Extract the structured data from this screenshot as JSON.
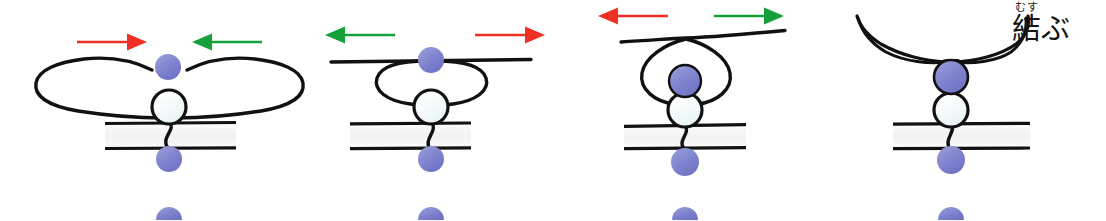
{
  "figure": {
    "width": 1106,
    "height": 220,
    "background": "#ffffff"
  },
  "caption": {
    "furigana": "むす",
    "base": "結ぶ",
    "full": "結ぶ",
    "reading": "musubu",
    "color": "#141414"
  },
  "colors": {
    "rope": "#111111",
    "membrane_line": "#111111",
    "membrane_fill": "#f4f4f4",
    "bead_blue": "#7b7fcc",
    "bead_blue_edge": "#6b6fc0",
    "bead_white": "#f2fafa",
    "bead_white_edge": "#111111",
    "arrow_red": "#ee3124",
    "arrow_green": "#16a03c",
    "background": "#ffffff"
  },
  "panels": [
    {
      "id": "panel-1",
      "index": 1,
      "label": "step-1-loose-bow",
      "rope_state": "two wide loose loops forming a bowtie above the membrane",
      "arrows": [
        {
          "name": "arrow-left-red-right",
          "color": "#ee3124",
          "direction": "right",
          "x1": 77,
          "y1": 42,
          "x2": 143,
          "y2": 42
        },
        {
          "name": "arrow-right-green-left",
          "color": "#16a03c",
          "direction": "left",
          "x1": 262,
          "y1": 42,
          "x2": 196,
          "y2": 42
        }
      ],
      "beads": [
        {
          "name": "bead-blue-top",
          "type": "blue",
          "cx": 168,
          "cy": 67,
          "r": 13
        },
        {
          "name": "bead-white-knot",
          "type": "white",
          "cx": 169,
          "cy": 107,
          "r": 17
        },
        {
          "name": "bead-blue-below-membrane",
          "type": "blue",
          "cx": 169,
          "cy": 159,
          "r": 13
        },
        {
          "name": "bead-blue-partial-bottom",
          "type": "blue-half",
          "cx": 169,
          "cy": 213,
          "r": 13
        }
      ],
      "membrane": {
        "x1": 105,
        "x2": 236,
        "y_top": 123,
        "y_bottom": 148
      }
    },
    {
      "id": "panel-2",
      "index": 2,
      "label": "step-2-single-flat-loop",
      "rope_state": "loops pulled into a single flat horizontal oval under a straight cord",
      "arrows": [
        {
          "name": "arrow-left-green-left",
          "color": "#16a03c",
          "direction": "left",
          "x1": 395,
          "y1": 35,
          "x2": 329,
          "y2": 35
        },
        {
          "name": "arrow-right-red-right",
          "color": "#ee3124",
          "direction": "right",
          "x1": 475,
          "y1": 35,
          "x2": 541,
          "y2": 35
        }
      ],
      "beads": [
        {
          "name": "bead-blue-top",
          "type": "blue",
          "cx": 431,
          "cy": 60,
          "r": 13
        },
        {
          "name": "bead-white-knot",
          "type": "white",
          "cx": 431,
          "cy": 107,
          "r": 17
        },
        {
          "name": "bead-blue-below-membrane",
          "type": "blue",
          "cx": 431,
          "cy": 159,
          "r": 13
        },
        {
          "name": "bead-blue-partial-bottom",
          "type": "blue-half",
          "cx": 431,
          "cy": 213,
          "r": 13
        }
      ],
      "membrane": {
        "x1": 350,
        "x2": 471,
        "y_top": 123,
        "y_bottom": 148
      }
    },
    {
      "id": "panel-3",
      "index": 3,
      "label": "step-3-loop-cinching",
      "rope_state": "loop narrowed into a round ring with blue bead drawn down into it",
      "arrows": [
        {
          "name": "arrow-left-red-left",
          "color": "#ee3124",
          "direction": "left",
          "x1": 668,
          "y1": 16,
          "x2": 602,
          "y2": 16
        },
        {
          "name": "arrow-right-green-right",
          "color": "#16a03c",
          "direction": "right",
          "x1": 714,
          "y1": 16,
          "x2": 780,
          "y2": 16
        },
        {
          "name": "arrow-third-panel-count",
          "color": "#ee3124",
          "direction": "none",
          "x1": 0,
          "y1": 0,
          "x2": 0,
          "y2": 0
        }
      ],
      "beads": [
        {
          "name": "bead-blue-in-loop",
          "type": "blue",
          "cx": 685,
          "cy": 81,
          "r": 16
        },
        {
          "name": "bead-white-knot",
          "type": "white",
          "cx": 685,
          "cy": 110,
          "r": 17
        },
        {
          "name": "bead-blue-below-membrane",
          "type": "blue",
          "cx": 685,
          "cy": 162,
          "r": 14
        },
        {
          "name": "bead-blue-partial-bottom",
          "type": "blue-half",
          "cx": 685,
          "cy": 213,
          "r": 13
        }
      ],
      "membrane": {
        "x1": 624,
        "x2": 746,
        "y_top": 125,
        "y_bottom": 148
      }
    },
    {
      "id": "panel-4",
      "index": 4,
      "label": "step-4-knot-tied",
      "rope_state": "knot fully tightened, two free ends sweep upward and outward",
      "arrows": [],
      "beads": [
        {
          "name": "bead-blue-knotted",
          "type": "blue",
          "cx": 951,
          "cy": 77,
          "r": 17
        },
        {
          "name": "bead-white-knot",
          "type": "white",
          "cx": 951,
          "cy": 110,
          "r": 17
        },
        {
          "name": "bead-blue-below-membrane",
          "type": "blue",
          "cx": 951,
          "cy": 160,
          "r": 14
        },
        {
          "name": "bead-blue-partial-bottom",
          "type": "blue-half",
          "cx": 951,
          "cy": 213,
          "r": 13
        }
      ],
      "membrane": {
        "x1": 893,
        "x2": 1030,
        "y_top": 123,
        "y_bottom": 148
      }
    }
  ]
}
